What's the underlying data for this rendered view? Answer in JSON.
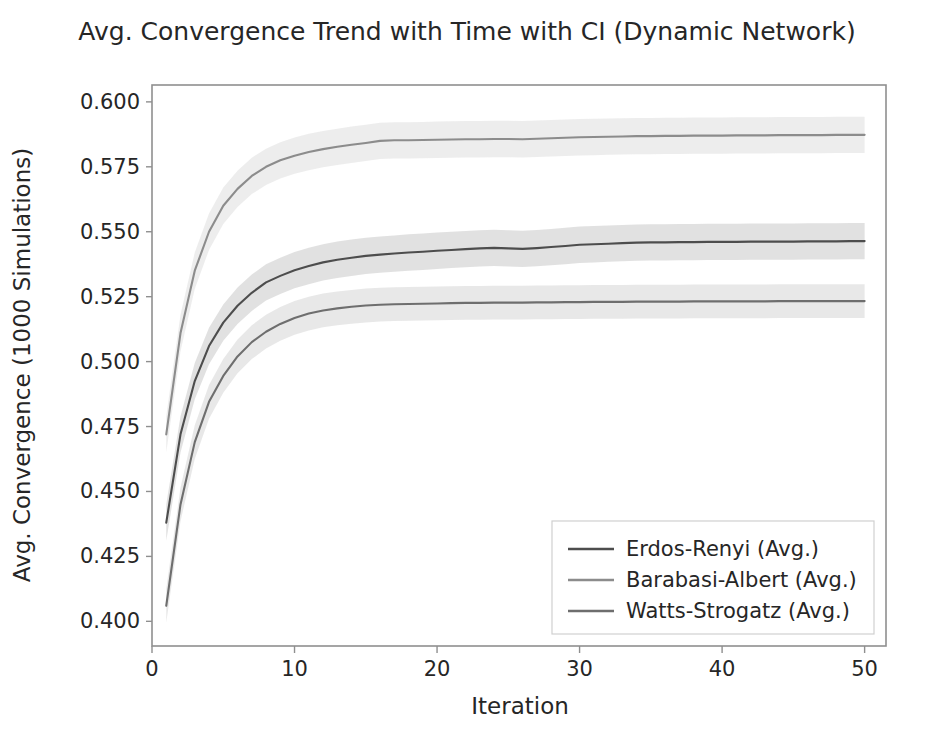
{
  "figure": {
    "width": 934,
    "height": 739,
    "background": "#ffffff",
    "frame_color": "#8f8f8f",
    "text_color": "#262626"
  },
  "chart_data": {
    "type": "line",
    "title": "Avg. Convergence Trend with Time with CI (Dynamic Network)",
    "xlabel": "Iteration",
    "ylabel": "Avg. Convergence (1000 Simulations)",
    "xlim": [
      0,
      51.5
    ],
    "ylim": [
      0.3905,
      0.6065
    ],
    "grid": false,
    "legend_position": "lower right",
    "xticks": [
      0,
      10,
      20,
      30,
      40,
      50
    ],
    "xtick_labels": [
      "0",
      "10",
      "20",
      "30",
      "40",
      "50"
    ],
    "yticks": [
      0.4,
      0.425,
      0.45,
      0.475,
      0.5,
      0.525,
      0.55,
      0.575,
      0.6
    ],
    "ytick_labels": [
      "0.400",
      "0.425",
      "0.450",
      "0.475",
      "0.500",
      "0.525",
      "0.550",
      "0.575",
      "0.600"
    ],
    "x": [
      1,
      2,
      3,
      4,
      5,
      6,
      7,
      8,
      9,
      10,
      11,
      12,
      13,
      14,
      15,
      16,
      17,
      18,
      19,
      20,
      21,
      22,
      23,
      24,
      25,
      26,
      27,
      28,
      29,
      30,
      31,
      32,
      33,
      34,
      35,
      36,
      37,
      38,
      39,
      40,
      41,
      42,
      43,
      44,
      45,
      46,
      47,
      48,
      49,
      50
    ],
    "series": [
      {
        "name": "Erdos-Renyi (Avg.)",
        "color": "#4d4d4d",
        "ci_color": "#c9c9c9",
        "ci_opacity": 0.55,
        "values": [
          0.438,
          0.472,
          0.4925,
          0.506,
          0.515,
          0.5215,
          0.5265,
          0.5305,
          0.533,
          0.5352,
          0.5368,
          0.5382,
          0.5392,
          0.54,
          0.5407,
          0.5412,
          0.5416,
          0.542,
          0.5423,
          0.5427,
          0.543,
          0.5433,
          0.5436,
          0.5438,
          0.5436,
          0.5434,
          0.5437,
          0.5441,
          0.5445,
          0.545,
          0.5452,
          0.5454,
          0.5456,
          0.5458,
          0.5459,
          0.5459,
          0.546,
          0.546,
          0.5461,
          0.5461,
          0.5461,
          0.5462,
          0.5462,
          0.5462,
          0.5462,
          0.5463,
          0.5463,
          0.5463,
          0.5464,
          0.5464
        ],
        "ci_lower": [
          0.431,
          0.465,
          0.4855,
          0.499,
          0.508,
          0.5145,
          0.5195,
          0.5235,
          0.526,
          0.5282,
          0.5298,
          0.5312,
          0.5322,
          0.533,
          0.5337,
          0.5342,
          0.5346,
          0.535,
          0.5353,
          0.5357,
          0.536,
          0.5363,
          0.5366,
          0.5368,
          0.5366,
          0.5364,
          0.5367,
          0.5371,
          0.5375,
          0.538,
          0.5382,
          0.5384,
          0.5386,
          0.5388,
          0.5389,
          0.5389,
          0.539,
          0.539,
          0.5391,
          0.5391,
          0.5391,
          0.5392,
          0.5392,
          0.5392,
          0.5392,
          0.5393,
          0.5393,
          0.5393,
          0.5394,
          0.5394
        ],
        "ci_upper": [
          0.445,
          0.479,
          0.4995,
          0.513,
          0.522,
          0.5285,
          0.5335,
          0.5375,
          0.54,
          0.5422,
          0.5438,
          0.5452,
          0.5462,
          0.547,
          0.5477,
          0.5482,
          0.5486,
          0.549,
          0.5493,
          0.5497,
          0.55,
          0.5503,
          0.5506,
          0.5508,
          0.5506,
          0.5504,
          0.5507,
          0.5511,
          0.5515,
          0.552,
          0.5522,
          0.5524,
          0.5526,
          0.5528,
          0.5529,
          0.5529,
          0.553,
          0.553,
          0.5531,
          0.5531,
          0.5531,
          0.5532,
          0.5532,
          0.5532,
          0.5532,
          0.5533,
          0.5533,
          0.5533,
          0.5534,
          0.5534
        ]
      },
      {
        "name": "Barabasi-Albert (Avg.)",
        "color": "#8c8c8c",
        "ci_color": "#dedede",
        "ci_opacity": 0.55,
        "values": [
          0.472,
          0.511,
          0.535,
          0.55,
          0.56,
          0.5665,
          0.5715,
          0.575,
          0.5775,
          0.5793,
          0.5807,
          0.5818,
          0.5827,
          0.5835,
          0.5842,
          0.585,
          0.5852,
          0.5852,
          0.5853,
          0.5854,
          0.5855,
          0.5856,
          0.5856,
          0.5857,
          0.5857,
          0.5856,
          0.5858,
          0.586,
          0.5862,
          0.5864,
          0.5865,
          0.5866,
          0.5867,
          0.5868,
          0.5868,
          0.5869,
          0.5869,
          0.587,
          0.587,
          0.587,
          0.5871,
          0.5871,
          0.5871,
          0.5872,
          0.5872,
          0.5872,
          0.5872,
          0.5873,
          0.5873,
          0.5873
        ],
        "ci_lower": [
          0.465,
          0.504,
          0.528,
          0.543,
          0.553,
          0.5595,
          0.5645,
          0.568,
          0.5705,
          0.5723,
          0.5737,
          0.5748,
          0.5757,
          0.5765,
          0.5772,
          0.578,
          0.5782,
          0.5782,
          0.5783,
          0.5784,
          0.5785,
          0.5786,
          0.5786,
          0.5787,
          0.5787,
          0.5786,
          0.5788,
          0.579,
          0.5792,
          0.5794,
          0.5795,
          0.5796,
          0.5797,
          0.5798,
          0.5798,
          0.5799,
          0.5799,
          0.58,
          0.58,
          0.58,
          0.5801,
          0.5801,
          0.5801,
          0.5802,
          0.5802,
          0.5802,
          0.5802,
          0.5803,
          0.5803,
          0.5803
        ],
        "ci_upper": [
          0.479,
          0.518,
          0.542,
          0.557,
          0.567,
          0.5735,
          0.5785,
          0.582,
          0.5845,
          0.5863,
          0.5877,
          0.5888,
          0.5897,
          0.5905,
          0.5912,
          0.592,
          0.5922,
          0.5922,
          0.5923,
          0.5924,
          0.5925,
          0.5926,
          0.5926,
          0.5927,
          0.5927,
          0.5926,
          0.5928,
          0.593,
          0.5932,
          0.5934,
          0.5935,
          0.5936,
          0.5937,
          0.5938,
          0.5938,
          0.5939,
          0.5939,
          0.594,
          0.594,
          0.594,
          0.5941,
          0.5941,
          0.5941,
          0.5942,
          0.5942,
          0.5942,
          0.5942,
          0.5943,
          0.5943,
          0.5943
        ]
      },
      {
        "name": "Watts-Strogatz (Avg.)",
        "color": "#6e6e6e",
        "ci_color": "#d6d6d6",
        "ci_opacity": 0.55,
        "values": [
          0.406,
          0.445,
          0.469,
          0.4845,
          0.4945,
          0.502,
          0.5075,
          0.5115,
          0.5145,
          0.5168,
          0.5185,
          0.5197,
          0.5205,
          0.5211,
          0.5216,
          0.5219,
          0.5221,
          0.5222,
          0.5223,
          0.5224,
          0.5225,
          0.5226,
          0.5226,
          0.5227,
          0.5227,
          0.5227,
          0.5228,
          0.5228,
          0.5229,
          0.5229,
          0.523,
          0.523,
          0.523,
          0.5231,
          0.5231,
          0.5231,
          0.5231,
          0.5232,
          0.5232,
          0.5232,
          0.5232,
          0.5232,
          0.5232,
          0.5233,
          0.5233,
          0.5233,
          0.5233,
          0.5233,
          0.5233,
          0.5233
        ],
        "ci_lower": [
          0.3995,
          0.4385,
          0.4625,
          0.478,
          0.488,
          0.4955,
          0.501,
          0.505,
          0.508,
          0.5103,
          0.512,
          0.5132,
          0.514,
          0.5146,
          0.5151,
          0.5154,
          0.5156,
          0.5157,
          0.5158,
          0.5159,
          0.516,
          0.5161,
          0.5161,
          0.5162,
          0.5162,
          0.5162,
          0.5163,
          0.5163,
          0.5164,
          0.5164,
          0.5165,
          0.5165,
          0.5165,
          0.5166,
          0.5166,
          0.5166,
          0.5166,
          0.5167,
          0.5167,
          0.5167,
          0.5167,
          0.5167,
          0.5167,
          0.5168,
          0.5168,
          0.5168,
          0.5168,
          0.5168,
          0.5168,
          0.5168
        ],
        "ci_upper": [
          0.4125,
          0.4515,
          0.4755,
          0.491,
          0.501,
          0.5085,
          0.514,
          0.518,
          0.521,
          0.5233,
          0.525,
          0.5262,
          0.527,
          0.5276,
          0.5281,
          0.5284,
          0.5286,
          0.5287,
          0.5288,
          0.5289,
          0.529,
          0.5291,
          0.5291,
          0.5292,
          0.5292,
          0.5292,
          0.5293,
          0.5293,
          0.5294,
          0.5294,
          0.5295,
          0.5295,
          0.5295,
          0.5296,
          0.5296,
          0.5296,
          0.5296,
          0.5297,
          0.5297,
          0.5297,
          0.5297,
          0.5297,
          0.5297,
          0.5298,
          0.5298,
          0.5298,
          0.5298,
          0.5298,
          0.5298,
          0.5298
        ]
      }
    ]
  },
  "legend": {
    "entries": [
      "Erdos-Renyi (Avg.)",
      "Barabasi-Albert (Avg.)",
      "Watts-Strogatz (Avg.)"
    ]
  }
}
